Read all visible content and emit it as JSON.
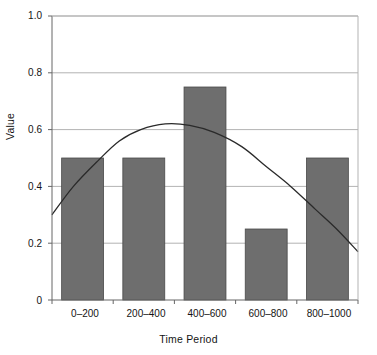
{
  "chart_data": {
    "type": "bar",
    "title": "",
    "subtitle": "",
    "xlabel": "Time Period",
    "ylabel": "Value",
    "categories": [
      "0–200",
      "200–400",
      "400–600",
      "600–800",
      "800–1000"
    ],
    "values": [
      0.5,
      0.5,
      0.75,
      0.25,
      0.5
    ],
    "series": [
      {
        "name": "Value",
        "type": "bar",
        "values": [
          0.5,
          0.5,
          0.75,
          0.25,
          0.5
        ]
      },
      {
        "name": "Trend",
        "type": "line",
        "x": [
          0,
          0.07,
          0.15,
          0.22,
          0.29,
          0.37,
          0.45,
          0.53,
          0.62,
          0.7,
          0.78,
          0.86,
          0.93,
          1.0
        ],
        "values": [
          0.3,
          0.4,
          0.49,
          0.56,
          0.6,
          0.62,
          0.615,
          0.59,
          0.54,
          0.47,
          0.4,
          0.32,
          0.25,
          0.17
        ]
      }
    ],
    "ylim": [
      0,
      1.0
    ],
    "ytick_labels": [
      "0",
      "0.2",
      "0.4",
      "0.6",
      "0.8",
      "1.0"
    ],
    "ytick_values": [
      0,
      0.2,
      0.4,
      0.6,
      0.8,
      1.0
    ],
    "grid": "horizontal",
    "legend": "none",
    "colors": {
      "bar_fill": "#6e6e6e",
      "bar_edge": "#4a4a4a",
      "line": "#2a2a2a",
      "gridline": "#b3b3b3",
      "axis": "#666666",
      "text": "#141414",
      "background": "#ffffff"
    }
  }
}
